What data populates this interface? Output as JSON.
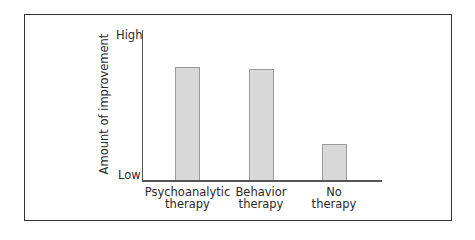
{
  "chart_data": {
    "type": "bar",
    "title": "",
    "xlabel": "",
    "ylabel": "Amount of improvement",
    "y_tick_labels": {
      "top": "High",
      "bottom": "Low"
    },
    "categories": [
      "Psychoanalytic therapy",
      "Behavior therapy",
      "No therapy"
    ],
    "category_lines": [
      [
        "Psychoanalytic",
        "therapy"
      ],
      [
        "Behavior",
        "therapy"
      ],
      [
        "No",
        "therapy"
      ]
    ],
    "values": [
      75,
      74,
      24
    ],
    "ylim": [
      0,
      100
    ],
    "grid": false,
    "legend": null,
    "bar_color": "#d8d8d8",
    "bar_edge_color": "#9a9a9a"
  }
}
